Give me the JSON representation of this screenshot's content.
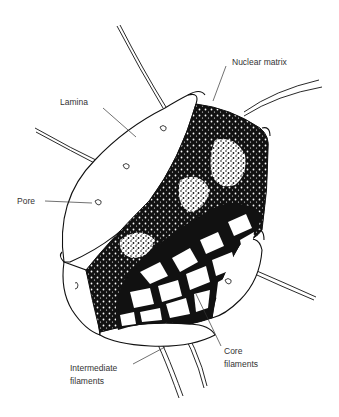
{
  "figure": {
    "background": "#ffffff",
    "ink_color": "#111111",
    "label_color": "#333333"
  },
  "labels": {
    "nuclear_matrix": "Nuclear matrix",
    "lamina": "Lamina",
    "pore": "Pore",
    "intermediate_filaments": {
      "line1": "Intermediate",
      "line2": "filaments"
    },
    "core_filaments": {
      "line1": "Core",
      "line2": "filaments"
    }
  }
}
